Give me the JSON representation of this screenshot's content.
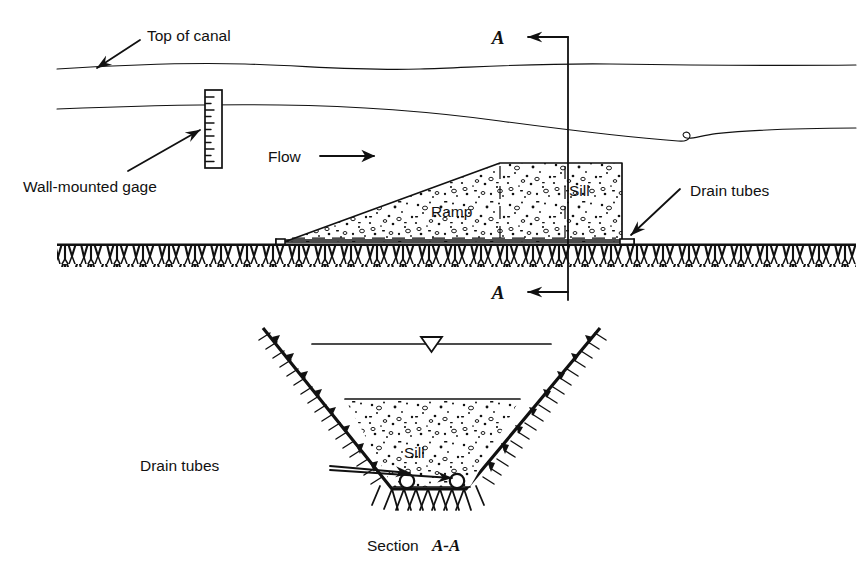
{
  "figure": {
    "caption_prefix": "Section ",
    "caption_section_id": "A-A",
    "background_color": "#ffffff",
    "ink_color": "#111111"
  },
  "profile_view": {
    "name": "Longitudinal profile of canal with ramp and sill",
    "labels": {
      "top_of_canal": "Top of canal",
      "wall_mounted_gage": "Wall-mounted gage",
      "flow": "Flow",
      "ramp": "Ramp",
      "sill": "Sill",
      "drain_tubes": "Drain tubes",
      "section_marker_top": "A",
      "section_marker_bottom": "A"
    },
    "icons": {
      "flow_arrow": "right-arrow-icon",
      "top_of_canal_leader": "leader-arrow-icon",
      "gage_leader": "leader-arrow-icon",
      "drain_tubes_leader": "leader-arrow-icon",
      "section_cut_line": "section-cut-line-icon",
      "ground_hatch": "earth-hatch-icon",
      "concrete_stipple": "concrete-fill-icon"
    },
    "gage_tick_count": 11
  },
  "section_view": {
    "name": "Cross section A-A of trapezoidal canal with sill",
    "labels": {
      "sill": "Sill",
      "drain_tubes": "Drain tubes"
    },
    "icons": {
      "water_surface_symbol": "water-level-triangle-icon",
      "bank_hatch": "earth-hatch-icon",
      "concrete_stipple": "concrete-fill-icon",
      "drain_tube_left": "drain-tube-circle-icon",
      "drain_tube_right": "drain-tube-circle-icon",
      "drain_tubes_leader": "leader-arrow-icon"
    },
    "drain_tube_count": 2
  }
}
